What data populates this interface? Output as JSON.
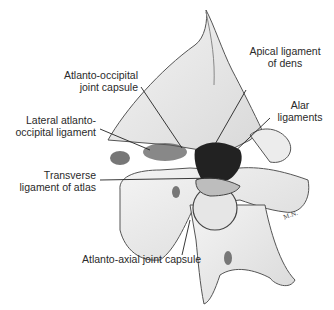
{
  "figure": {
    "labels": [
      {
        "id": "atlanto-occipital-joint-capsule",
        "line1": "Atlanto-occipital",
        "line2": "joint capsule"
      },
      {
        "id": "apical-ligament-of-dens",
        "line1": "Apical ligament",
        "line2": "of dens"
      },
      {
        "id": "lateral-atlanto-occipital-ligament",
        "line1": "Lateral atlanto-",
        "line2": "occipital ligament"
      },
      {
        "id": "alar-ligaments",
        "line1": "Alar",
        "line2": "ligaments"
      },
      {
        "id": "transverse-ligament-of-atlas",
        "line1": "Transverse",
        "line2": "ligament of atlas"
      },
      {
        "id": "atlanto-axial-joint-capsule",
        "line1": "Atlanto-axial joint capsule"
      }
    ],
    "signature": "M.N."
  }
}
